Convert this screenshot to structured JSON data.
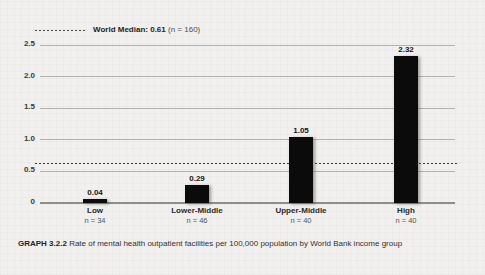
{
  "legend": {
    "label_bold": "World Median: 0.61",
    "label_paren": "(n = 160)"
  },
  "caption": {
    "tag": "GRAPH 3.2.2",
    "text": "Rate of mental health outpatient facilities per 100,000 population by World Bank income group"
  },
  "chart_data": {
    "type": "bar",
    "title": "GRAPH 3.2.2 Rate of mental health outpatient facilities per 100,000 population by World Bank income group",
    "categories": [
      "Low",
      "Lower-Middle",
      "Upper-Middle",
      "High"
    ],
    "n_labels": [
      "n = 34",
      "n = 46",
      "n = 40",
      "n = 40"
    ],
    "values": [
      0.04,
      0.29,
      1.05,
      2.32
    ],
    "value_labels": [
      "0.04",
      "0.29",
      "1.05",
      "2.32"
    ],
    "ylim": [
      0,
      2.5
    ],
    "yticks": [
      0,
      0.5,
      1.0,
      1.5,
      2.0,
      2.5
    ],
    "ytick_labels": [
      "0",
      "0.5",
      "1.0",
      "1.5",
      "2.0",
      "2.5"
    ],
    "reference_line": {
      "value": 0.61,
      "label": "World Median: 0.61 (n = 160)"
    },
    "grid": true,
    "legend_position": "top-left",
    "xlabel": "",
    "ylabel": "",
    "colors": {
      "bar": "#0b0b0b",
      "gridline": "#b3b1ae",
      "axis": "#8f8d8a",
      "background": "#f1f0ee"
    }
  }
}
